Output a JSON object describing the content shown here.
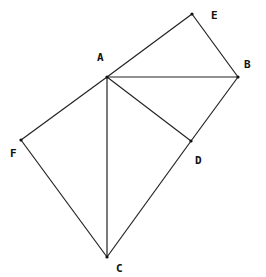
{
  "diagram": {
    "points": [
      {
        "id": "A",
        "x": 107,
        "y": 77,
        "lx": 97,
        "ly": 61
      },
      {
        "id": "B",
        "x": 238,
        "y": 77,
        "lx": 244,
        "ly": 68
      },
      {
        "id": "C",
        "x": 107,
        "y": 257,
        "lx": 116,
        "ly": 272
      },
      {
        "id": "D",
        "x": 191,
        "y": 141,
        "lx": 195,
        "ly": 164
      },
      {
        "id": "E",
        "x": 192,
        "y": 14,
        "lx": 211,
        "ly": 19
      },
      {
        "id": "F",
        "x": 21,
        "y": 140,
        "lx": 10,
        "ly": 157
      }
    ],
    "segments": [
      [
        "A",
        "E"
      ],
      [
        "E",
        "B"
      ],
      [
        "A",
        "B"
      ],
      [
        "A",
        "D"
      ],
      [
        "B",
        "D"
      ],
      [
        "A",
        "F"
      ],
      [
        "F",
        "C"
      ],
      [
        "A",
        "C"
      ],
      [
        "C",
        "D"
      ]
    ]
  }
}
